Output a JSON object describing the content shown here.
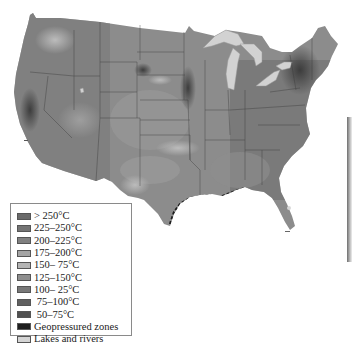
{
  "map": {
    "subject": "Geothermal resource temperature map of the contiguous United States",
    "colors": {
      "land_base": "#8c8c8c",
      "land_dark": "#5a5a5a",
      "land_light": "#b0b0b0",
      "lakes": "#d2d2d2",
      "state_lines": "#3a3a3a",
      "background": "#ffffff"
    }
  },
  "legend": {
    "items": [
      {
        "label": "> 250°C",
        "color": "#6a6a6a"
      },
      {
        "label": "225–250°C",
        "color": "#747474"
      },
      {
        "label": "200–225°C",
        "color": "#808080"
      },
      {
        "label": "175–200°C",
        "color": "#a4a4a4"
      },
      {
        "label": "150– 75°C",
        "color": "#b4b4b4"
      },
      {
        "label": "125–150°C",
        "color": "#8e8e8e"
      },
      {
        "label": "100– 25°C",
        "color": "#787878"
      },
      {
        "label": " 75–100°C",
        "color": "#606060"
      },
      {
        "label": " 50–75°C",
        "color": "#505050"
      },
      {
        "label": "Geopressured zones",
        "color": "#1e1e1e"
      },
      {
        "label": "Lakes and rivers",
        "color": "#d4d4d4"
      }
    ]
  }
}
